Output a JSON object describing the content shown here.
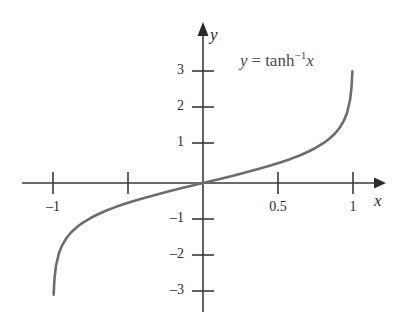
{
  "figure": {
    "background_color": "#ffffff",
    "axis_color": "#3a3a3a",
    "curve_color": "#6d6d6d",
    "text_color": "#2b2b2b",
    "equation_color": "#4a4a4a",
    "x_axis_label": "x",
    "y_axis_label": "y",
    "equation": {
      "lhs": "y",
      "equals": "=",
      "func": "tanh",
      "exponent": "−1",
      "arg": "x",
      "full_text": "y = tanh−1x"
    }
  },
  "chart_data": {
    "type": "line",
    "title": "",
    "xlabel": "x",
    "ylabel": "y",
    "equation": "y = tanh^-1 x",
    "xlim": [
      -1.2,
      1.2
    ],
    "ylim": [
      -3.4,
      3.4
    ],
    "grid": false,
    "legend": "none",
    "annotations": [
      {
        "text": "y = tanh−1x",
        "x": 0.35,
        "y": 3.1
      }
    ],
    "xticks": [
      -1,
      -0.5,
      0.5,
      1
    ],
    "xticklabels": [
      "–1",
      "",
      "0.5",
      "1"
    ],
    "yticks": [
      -3,
      -2,
      -1,
      1,
      2,
      3
    ],
    "yticklabels": [
      "–3",
      "–2",
      "–1",
      "1",
      "2",
      "3"
    ],
    "series": [
      {
        "name": "y = tanh^-1 x",
        "color": "#6d6d6d",
        "x": [
          -0.9959,
          -0.99,
          -0.98,
          -0.96,
          -0.94,
          -0.91,
          -0.88,
          -0.84,
          -0.8,
          -0.75,
          -0.7,
          -0.64,
          -0.58,
          -0.52,
          -0.45,
          -0.38,
          -0.3,
          -0.22,
          -0.14,
          -0.07,
          0,
          0.07,
          0.14,
          0.22,
          0.3,
          0.38,
          0.45,
          0.52,
          0.58,
          0.64,
          0.7,
          0.75,
          0.8,
          0.84,
          0.88,
          0.91,
          0.94,
          0.96,
          0.98,
          0.99,
          0.9959
        ],
        "y": [
          -3.1,
          -2.6467,
          -2.2976,
          -1.9459,
          -1.7381,
          -1.5275,
          -1.3758,
          -1.2212,
          -1.0986,
          -0.973,
          -0.8673,
          -0.7582,
          -0.6625,
          -0.5763,
          -0.4847,
          -0.4001,
          -0.3095,
          -0.2237,
          -0.1409,
          -0.0701,
          0,
          0.0701,
          0.1409,
          0.2237,
          0.3095,
          0.4001,
          0.4847,
          0.5763,
          0.6625,
          0.7582,
          0.8673,
          0.973,
          1.0986,
          1.2212,
          1.3758,
          1.5275,
          1.7381,
          1.9459,
          2.2976,
          2.6467,
          3.1
        ]
      }
    ]
  }
}
